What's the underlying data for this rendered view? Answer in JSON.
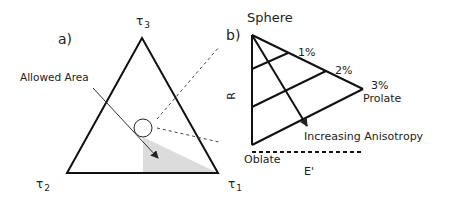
{
  "panel_a": {
    "label": "a)",
    "vertex_top": "τ",
    "vertex_top_sub": "3",
    "vertex_left": "τ",
    "vertex_left_sub": "2",
    "vertex_right": "τ",
    "vertex_right_sub": "1",
    "annotation": "Allowed Area",
    "shade_color": "#d9d9d9"
  },
  "panel_b": {
    "label": "b)",
    "top_label": "Sphere",
    "y_axis_label": "R",
    "x_axis_label": "E'",
    "bottom_label": "Oblate",
    "right_label": "Prolate",
    "iso_labels": [
      "1%",
      "2%",
      "3%"
    ],
    "arrow_label": "Increasing Anisotropy"
  }
}
